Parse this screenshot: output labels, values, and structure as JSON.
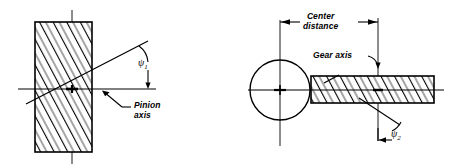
{
  "figure": {
    "type": "engineering-diagram",
    "background_color": "#ffffff",
    "line_color": "#000000",
    "width": 451,
    "height": 165
  },
  "left_view": {
    "name": "pinion-end-view",
    "description": "Hatched rectangle representing pinion viewed on end, with horizontal pinion axis and inclined helix line",
    "axis_label": "Pinion\naxis",
    "axis_label_line1": "Pinion",
    "axis_label_line2": "axis",
    "helix_angle_symbol": "ψ",
    "helix_angle_subscript": "1",
    "rect": {
      "x": 35,
      "y": 22,
      "width": 57,
      "height": 130
    },
    "horizontal_axis": {
      "x1": 18,
      "y1": 89,
      "x2": 156,
      "y2": 89
    },
    "vertical_centerline": {
      "x": 72,
      "y1": 10,
      "y2": 164
    },
    "helix_line": {
      "x1": 26,
      "y1": 104,
      "x2": 148,
      "y2": 41
    },
    "hatch_angle_deg": 27,
    "hatch_spacing": 11
  },
  "right_view": {
    "name": "gear-and-pinion-plan-view",
    "description": "Circle representing gear end view with hatched bar representing pinion in plan view",
    "gear_axis_label": "Gear axis",
    "center_distance_label_line1": "Center",
    "center_distance_label_line2": "distance",
    "helix_angle_symbol": "ψ",
    "helix_angle_subscript": "2",
    "circle": {
      "cx": 280,
      "cy": 90,
      "r": 30
    },
    "bar": {
      "x": 311,
      "y": 76,
      "width": 123,
      "height": 27
    },
    "horizontal_axis": {
      "x1": 248,
      "y1": 90,
      "x2": 444,
      "y2": 90
    },
    "left_vertical_line": {
      "x": 280,
      "y1": 20,
      "y2": 146
    },
    "right_vertical_line": {
      "x": 378,
      "y1": 18,
      "y2": 141
    },
    "dimension_line": {
      "x1": 280,
      "y1": 22,
      "x2": 378,
      "y2": 22
    },
    "hatch_angle_deg": 27,
    "hatch_spacing": 11
  },
  "annotations": [
    {
      "name": "pinion-axis-label",
      "text_line1": "Pinion",
      "text_line2": "axis"
    },
    {
      "name": "psi1-label",
      "text": "ψ",
      "sub": "1"
    },
    {
      "name": "center-distance-label",
      "text_line1": "Center",
      "text_line2": "distance"
    },
    {
      "name": "gear-axis-label",
      "text": "Gear axis"
    },
    {
      "name": "psi2-label",
      "text": "ψ",
      "sub": "2"
    }
  ]
}
